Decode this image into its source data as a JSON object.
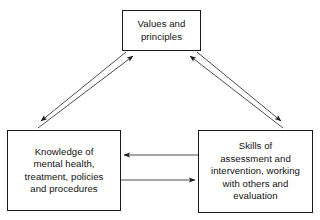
{
  "diagram": {
    "type": "triangular-cycle-diagram",
    "background_color": "#ffffff",
    "border_color": "#1a1a1a",
    "text_color": "#111111",
    "nodes": [
      {
        "id": "values",
        "label": "Values and\nprinciples",
        "position": "top-center"
      },
      {
        "id": "knowledge",
        "label": "Knowledge of\nmental health,\ntreatment, policies\nand procedures",
        "position": "bottom-left"
      },
      {
        "id": "skills",
        "label": "Skills of\nassessment and\nintervention, working\nwith others and\nevaluation",
        "position": "bottom-right"
      }
    ],
    "connectors": [
      {
        "id": "knowledge-to-values",
        "from": "knowledge",
        "to": "values",
        "style": "single-arrow-diagonal",
        "direction": "up-right"
      },
      {
        "id": "values-to-knowledge",
        "from": "values",
        "to": "knowledge",
        "style": "single-arrow-diagonal",
        "direction": "down-left"
      },
      {
        "id": "skills-to-values",
        "from": "skills",
        "to": "values",
        "style": "single-arrow-diagonal",
        "direction": "up-left"
      },
      {
        "id": "values-to-skills",
        "from": "values",
        "to": "skills",
        "style": "single-arrow-diagonal",
        "direction": "down-right"
      },
      {
        "id": "skills-to-knowledge",
        "from": "skills",
        "to": "knowledge",
        "style": "single-arrow-horizontal",
        "direction": "left"
      },
      {
        "id": "knowledge-to-skills",
        "from": "knowledge",
        "to": "skills",
        "style": "single-arrow-horizontal",
        "direction": "right"
      }
    ]
  }
}
